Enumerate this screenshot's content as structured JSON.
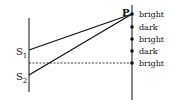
{
  "diagram": {
    "sources": [
      {
        "label": "S",
        "sub": "1",
        "x": 29,
        "y": 50
      },
      {
        "label": "S",
        "sub": "2",
        "x": 29,
        "y": 75
      }
    ],
    "point": {
      "label": "P",
      "x": 132,
      "y": 14
    },
    "fringes": [
      {
        "label": "bright",
        "y": 14
      },
      {
        "label": "dark",
        "y": 27
      },
      {
        "label": "bright",
        "y": 39
      },
      {
        "label": "dark",
        "y": 51
      },
      {
        "label": "bright",
        "y": 63
      }
    ],
    "colors": {
      "stroke": "#111111",
      "background": "#ffffff"
    }
  }
}
